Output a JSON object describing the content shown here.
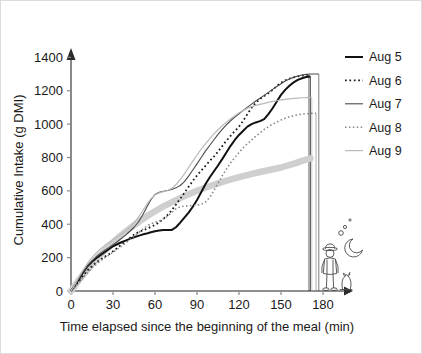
{
  "chart_data": {
    "type": "line",
    "title": "",
    "xlabel": "Time elapsed since the beginning of the meal (min)",
    "ylabel": "Cumulative Intake (g DMI)",
    "xlim": [
      0,
      200
    ],
    "ylim": [
      0,
      1450
    ],
    "xticks": [
      "0",
      "30",
      "60",
      "90",
      "120",
      "150",
      "180"
    ],
    "xtick_values": [
      0,
      30,
      60,
      90,
      120,
      150,
      180
    ],
    "yticks": [
      "0",
      "200",
      "400",
      "600",
      "800",
      "1000",
      "1200",
      "1400"
    ],
    "ytick_values": [
      0,
      200,
      400,
      600,
      800,
      1000,
      1200,
      1400
    ],
    "grid": false,
    "legend_position": "right",
    "series": [
      {
        "name": "Aug 5",
        "color": "#111111",
        "style": "solid",
        "width": 2.0,
        "end_time": 171,
        "end_value": 1285,
        "x": [
          0,
          3,
          6,
          9,
          12,
          15,
          18,
          21,
          24,
          27,
          30,
          33,
          36,
          39,
          42,
          45,
          48,
          51,
          54,
          57,
          60,
          63,
          66,
          69,
          72,
          75,
          78,
          81,
          84,
          87,
          90,
          93,
          96,
          99,
          102,
          105,
          108,
          111,
          114,
          117,
          120,
          123,
          126,
          129,
          132,
          135,
          138,
          141,
          144,
          147,
          150,
          153,
          156,
          159,
          162,
          165,
          168,
          171
        ],
        "y": [
          0,
          35,
          75,
          115,
          150,
          175,
          196,
          215,
          232,
          250,
          268,
          280,
          292,
          302,
          312,
          322,
          330,
          338,
          344,
          352,
          358,
          362,
          365,
          366,
          366,
          382,
          410,
          440,
          470,
          505,
          545,
          592,
          640,
          680,
          716,
          752,
          790,
          830,
          870,
          905,
          935,
          960,
          985,
          1000,
          1010,
          1018,
          1030,
          1060,
          1095,
          1135,
          1175,
          1205,
          1230,
          1250,
          1265,
          1275,
          1282,
          1285
        ]
      },
      {
        "name": "Aug 6",
        "color": "#1a1a1a",
        "style": "dotted",
        "width": 1.8,
        "end_time": 170,
        "end_value": 1295,
        "x": [
          0,
          3,
          6,
          9,
          12,
          15,
          18,
          21,
          24,
          27,
          30,
          33,
          36,
          39,
          42,
          45,
          48,
          51,
          54,
          57,
          60,
          63,
          66,
          69,
          72,
          75,
          78,
          81,
          84,
          87,
          90,
          93,
          96,
          99,
          102,
          105,
          108,
          111,
          114,
          117,
          120,
          123,
          126,
          129,
          132,
          135,
          138,
          141,
          144,
          147,
          150,
          153,
          156,
          159,
          162,
          165,
          168,
          170
        ],
        "y": [
          0,
          30,
          62,
          95,
          125,
          150,
          170,
          188,
          205,
          220,
          238,
          258,
          278,
          298,
          318,
          338,
          352,
          362,
          372,
          384,
          396,
          412,
          432,
          456,
          484,
          518,
          552,
          588,
          625,
          660,
          692,
          722,
          750,
          778,
          805,
          835,
          868,
          900,
          930,
          958,
          985,
          1020,
          1060,
          1098,
          1128,
          1150,
          1168,
          1185,
          1205,
          1228,
          1248,
          1262,
          1272,
          1280,
          1286,
          1290,
          1293,
          1295
        ]
      },
      {
        "name": "Aug 7",
        "color": "#4a4a4a",
        "style": "solid",
        "width": 1.1,
        "end_time": 177,
        "end_value": 1300,
        "x": [
          0,
          3,
          6,
          9,
          12,
          15,
          18,
          21,
          24,
          27,
          30,
          33,
          36,
          39,
          42,
          45,
          48,
          51,
          54,
          57,
          60,
          63,
          66,
          69,
          72,
          75,
          78,
          81,
          84,
          87,
          90,
          93,
          96,
          99,
          102,
          105,
          108,
          111,
          114,
          117,
          120,
          123,
          126,
          129,
          132,
          135,
          138,
          141,
          144,
          147,
          150,
          153,
          156,
          159,
          162,
          165,
          168,
          171,
          174,
          177
        ],
        "y": [
          0,
          38,
          80,
          118,
          152,
          180,
          205,
          225,
          243,
          260,
          278,
          295,
          315,
          335,
          358,
          382,
          412,
          452,
          500,
          545,
          578,
          592,
          598,
          602,
          608,
          618,
          632,
          655,
          688,
          725,
          762,
          800,
          838,
          872,
          905,
          938,
          968,
          996,
          1020,
          1042,
          1062,
          1082,
          1102,
          1120,
          1138,
          1155,
          1172,
          1190,
          1208,
          1225,
          1242,
          1258,
          1270,
          1280,
          1288,
          1294,
          1298,
          1300,
          1300,
          1300
        ]
      },
      {
        "name": "Aug 8",
        "color": "#8a8a8a",
        "style": "dotted",
        "width": 1.6,
        "end_time": 175,
        "end_value": 1065,
        "x": [
          0,
          3,
          6,
          9,
          12,
          15,
          18,
          21,
          24,
          27,
          30,
          33,
          36,
          39,
          42,
          45,
          48,
          51,
          54,
          57,
          60,
          63,
          66,
          69,
          72,
          75,
          78,
          81,
          84,
          87,
          90,
          93,
          96,
          99,
          102,
          105,
          108,
          111,
          114,
          117,
          120,
          123,
          126,
          129,
          132,
          135,
          138,
          141,
          144,
          147,
          150,
          153,
          156,
          159,
          162,
          165,
          168,
          171,
          175
        ],
        "y": [
          0,
          25,
          55,
          85,
          112,
          138,
          160,
          180,
          198,
          215,
          232,
          250,
          268,
          288,
          308,
          328,
          348,
          368,
          388,
          402,
          412,
          420,
          432,
          448,
          470,
          492,
          505,
          508,
          510,
          512,
          515,
          520,
          532,
          560,
          600,
          645,
          690,
          730,
          768,
          800,
          830,
          858,
          882,
          905,
          928,
          948,
          968,
          985,
          1000,
          1012,
          1025,
          1035,
          1044,
          1050,
          1056,
          1060,
          1062,
          1064,
          1065
        ]
      },
      {
        "name": "Aug 9",
        "color": "#b9b9b9",
        "style": "solid",
        "width": 1.2,
        "end_time": 172,
        "end_value": 1160,
        "x": [
          0,
          3,
          6,
          9,
          12,
          15,
          18,
          21,
          24,
          27,
          30,
          33,
          36,
          39,
          42,
          45,
          48,
          51,
          54,
          57,
          60,
          63,
          66,
          69,
          72,
          75,
          78,
          81,
          84,
          87,
          90,
          93,
          96,
          99,
          102,
          105,
          108,
          111,
          114,
          117,
          120,
          123,
          126,
          129,
          132,
          135,
          138,
          141,
          144,
          147,
          150,
          153,
          156,
          159,
          162,
          165,
          168,
          172
        ],
        "y": [
          0,
          42,
          88,
          130,
          168,
          200,
          228,
          252,
          272,
          290,
          308,
          325,
          342,
          360,
          382,
          408,
          440,
          478,
          518,
          552,
          575,
          588,
          595,
          602,
          615,
          638,
          668,
          702,
          740,
          778,
          815,
          850,
          882,
          912,
          940,
          966,
          990,
          1012,
          1032,
          1050,
          1068,
          1082,
          1095,
          1105,
          1112,
          1118,
          1124,
          1130,
          1136,
          1140,
          1145,
          1148,
          1151,
          1154,
          1156,
          1158,
          1159,
          1160
        ]
      },
      {
        "name": "Aug 9 mean trend",
        "color": "#cfcfcf",
        "style": "thick-smooth",
        "width": 6.5,
        "end_time": 171,
        "end_value": 795,
        "x": [
          0,
          5,
          10,
          15,
          20,
          25,
          30,
          35,
          40,
          45,
          50,
          55,
          60,
          65,
          70,
          75,
          80,
          85,
          90,
          95,
          100,
          105,
          110,
          115,
          120,
          125,
          130,
          135,
          140,
          145,
          150,
          155,
          160,
          165,
          171
        ],
        "y": [
          0,
          58,
          112,
          162,
          208,
          250,
          290,
          328,
          362,
          394,
          424,
          452,
          478,
          502,
          524,
          545,
          565,
          583,
          600,
          616,
          631,
          645,
          658,
          670,
          682,
          693,
          703,
          713,
          722,
          731,
          740,
          752,
          765,
          780,
          795
        ]
      }
    ],
    "terminal_lines": [
      {
        "series": "Aug 5",
        "time": 171,
        "top": 1285
      },
      {
        "series": "Aug 6",
        "time": 170,
        "top": 1295
      },
      {
        "series": "Aug 7",
        "time": 177,
        "top": 1300
      },
      {
        "series": "Aug 8",
        "time": 175,
        "top": 1065
      },
      {
        "series": "Aug 9",
        "time": 172,
        "top": 1160
      }
    ],
    "annotation": {
      "name": "farmer-and-dog-sketch",
      "description": "line sketch of a farmer in a hat with a dog, a crescent moon and sleep bubbles"
    }
  },
  "legend": {
    "items": [
      {
        "label": "Aug 5"
      },
      {
        "label": "Aug 6"
      },
      {
        "label": "Aug 7"
      },
      {
        "label": "Aug 8"
      },
      {
        "label": "Aug 9"
      }
    ]
  }
}
